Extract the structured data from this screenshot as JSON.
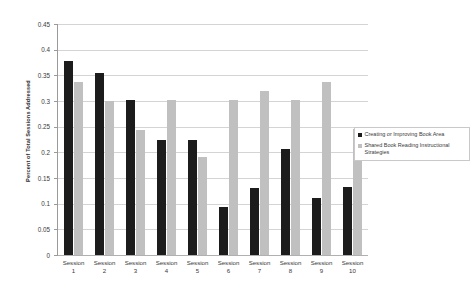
{
  "chart_data": {
    "type": "bar",
    "title": "",
    "xlabel": "",
    "ylabel": "Percent of Total Sessions Addressed",
    "ylim": [
      0,
      0.45
    ],
    "ytick_labels": [
      "0.45",
      "0.4",
      "0.35",
      "0.3",
      "0.25",
      "0.2",
      "0.15",
      "0.1",
      "0.05",
      "0"
    ],
    "ytick_values": [
      0.45,
      0.4,
      0.35,
      0.3,
      0.25,
      0.2,
      0.15,
      0.1,
      0.05,
      0
    ],
    "grid": true,
    "legend_position": "right",
    "categories": [
      "Session 1",
      "Session 2",
      "Session 3",
      "Session 4",
      "Session 5",
      "Session 6",
      "Session 7",
      "Session 8",
      "Session 9",
      "Session 10"
    ],
    "series": [
      {
        "name": "Creating or Improving Book Area",
        "color": "#1c1c1c",
        "values": [
          0.378,
          0.355,
          0.302,
          0.225,
          0.225,
          0.093,
          0.131,
          0.207,
          0.112,
          0.132
        ]
      },
      {
        "name": "Shared Book Reading Instructional Strategies",
        "color": "#c0c0c0",
        "values": [
          0.337,
          0.301,
          0.244,
          0.302,
          0.19,
          0.302,
          0.32,
          0.302,
          0.337,
          0.245
        ]
      }
    ]
  },
  "legend": {
    "entries": [
      "Creating or Improving Book Area",
      "Shared Book Reading Instructional Strategies"
    ]
  },
  "colors": {
    "series_a": "#1c1c1c",
    "series_b": "#c0c0c0",
    "gridline": "#d4d4d4",
    "axis": "#9a9a9a",
    "background": "#ffffff"
  }
}
